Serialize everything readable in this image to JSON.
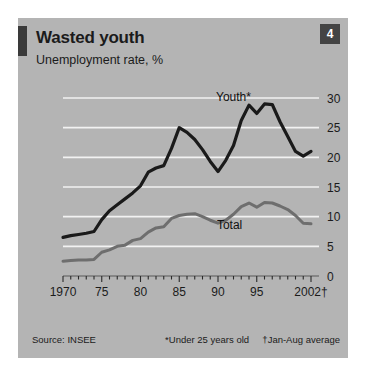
{
  "panel": {
    "badge": "4",
    "title": "Wasted youth",
    "subtitle": "Unemployment rate, %",
    "source": "Source: INSEE",
    "note_star": "*Under 25 years old",
    "note_dagger": "†Jan-Aug average",
    "colors": {
      "background": "#b4b4b4",
      "gridline": "#f2f2f2",
      "youth_line": "#1a1a1a",
      "total_line": "#6e6e6e",
      "badge": "#444444",
      "rule": "#3a3a3a"
    }
  },
  "chart_data": {
    "type": "line",
    "title": "Wasted youth",
    "subtitle": "Unemployment rate, %",
    "xlabel": "",
    "ylabel": "Unemployment rate, %",
    "ylim": [
      0,
      30
    ],
    "xlim": [
      1970,
      2002
    ],
    "yticks": [
      0,
      5,
      10,
      15,
      20,
      25,
      30
    ],
    "xticks": [
      1970,
      1975,
      1980,
      1985,
      1990,
      1995,
      2002
    ],
    "xtick_labels": [
      "1970",
      "75",
      "80",
      "85",
      "90",
      "95",
      "2002†"
    ],
    "grid": true,
    "minor_xticks_interval": 1,
    "legend_position": "inline-annotation",
    "x": [
      1970,
      1971,
      1972,
      1973,
      1974,
      1975,
      1976,
      1977,
      1978,
      1979,
      1980,
      1981,
      1982,
      1983,
      1984,
      1985,
      1986,
      1987,
      1988,
      1989,
      1990,
      1991,
      1992,
      1993,
      1994,
      1995,
      1996,
      1997,
      1998,
      1999,
      2000,
      2001,
      2002
    ],
    "series": [
      {
        "name": "Youth*",
        "label": "Youth*",
        "color": "#1a1a1a",
        "values": [
          6.5,
          6.8,
          7.0,
          7.2,
          7.5,
          9.5,
          11.0,
          12.0,
          13.0,
          14.0,
          15.2,
          17.5,
          18.2,
          18.6,
          21.5,
          25.0,
          24.2,
          23.0,
          21.3,
          19.3,
          17.6,
          19.5,
          22.0,
          26.2,
          28.8,
          27.4,
          29.0,
          28.9,
          26.0,
          23.5,
          21.0,
          20.2,
          21.0
        ]
      },
      {
        "name": "Total",
        "label": "Total",
        "color": "#6e6e6e",
        "values": [
          2.5,
          2.6,
          2.7,
          2.7,
          2.8,
          4.0,
          4.4,
          5.0,
          5.2,
          6.0,
          6.3,
          7.4,
          8.1,
          8.3,
          9.7,
          10.2,
          10.4,
          10.5,
          10.0,
          9.4,
          8.9,
          9.4,
          10.4,
          11.7,
          12.3,
          11.6,
          12.4,
          12.3,
          11.8,
          11.2,
          10.2,
          8.9,
          8.8
        ]
      }
    ],
    "annotations": [
      {
        "text": "Youth*",
        "x": 1992.0,
        "y": 29.5
      },
      {
        "text": "Total",
        "x": 1991.5,
        "y": 8.0
      }
    ]
  }
}
